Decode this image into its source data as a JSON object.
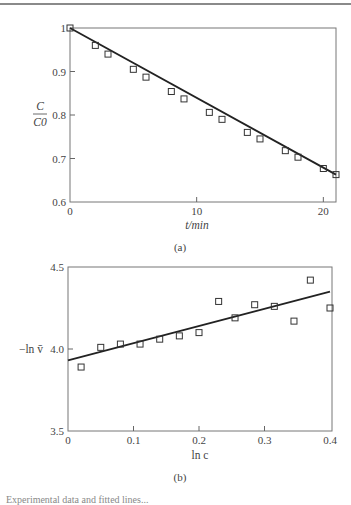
{
  "chart_data": [
    {
      "type": "scatter",
      "panel_label": "(a)",
      "title": "",
      "xlabel": "t/min",
      "ylabel": "C/C0",
      "ylabel_num": "C",
      "ylabel_den": "C0",
      "xlim": [
        0,
        21
      ],
      "ylim": [
        0.6,
        1.0
      ],
      "xticks": [
        0,
        10,
        20
      ],
      "xtick_labels": [
        "0",
        "10",
        "20"
      ],
      "yticks": [
        0.6,
        0.7,
        0.8,
        0.9,
        1.0
      ],
      "ytick_labels": [
        "0.6",
        "0.7",
        "0.8",
        "0.9",
        "1"
      ],
      "grid": false,
      "marker": "open-square",
      "x": [
        0,
        2,
        3,
        5,
        6,
        8,
        9,
        11,
        12,
        14,
        15,
        17,
        18,
        20,
        21
      ],
      "y": [
        1.0,
        0.96,
        0.94,
        0.905,
        0.887,
        0.854,
        0.837,
        0.806,
        0.79,
        0.76,
        0.745,
        0.718,
        0.703,
        0.677,
        0.663
      ],
      "fit_line": {
        "x": [
          0,
          21
        ],
        "y": [
          1.0,
          0.663
        ]
      }
    },
    {
      "type": "scatter",
      "panel_label": "(b)",
      "title": "",
      "xlabel": "ln c",
      "ylabel": "−ln v̄",
      "xlim": [
        0,
        0.4
      ],
      "ylim": [
        3.5,
        4.5
      ],
      "xticks": [
        0,
        0.1,
        0.2,
        0.3,
        0.4
      ],
      "xtick_labels": [
        "0",
        "0.1",
        "0.2",
        "0.3",
        "0.4"
      ],
      "yticks": [
        3.5,
        4.0,
        4.5
      ],
      "ytick_labels": [
        "3.5",
        "4.0",
        "4.5"
      ],
      "grid": false,
      "marker": "open-square",
      "x": [
        0.02,
        0.05,
        0.08,
        0.11,
        0.14,
        0.17,
        0.2,
        0.23,
        0.255,
        0.285,
        0.315,
        0.345,
        0.37,
        0.4
      ],
      "y": [
        3.89,
        4.01,
        4.03,
        4.03,
        4.06,
        4.08,
        4.1,
        4.29,
        4.19,
        4.27,
        4.26,
        4.17,
        4.42,
        4.25
      ],
      "fit_line": {
        "x": [
          0,
          0.4
        ],
        "y": [
          3.93,
          4.35
        ]
      }
    }
  ],
  "caption_fragment": "Experimental data and fitted lines..."
}
